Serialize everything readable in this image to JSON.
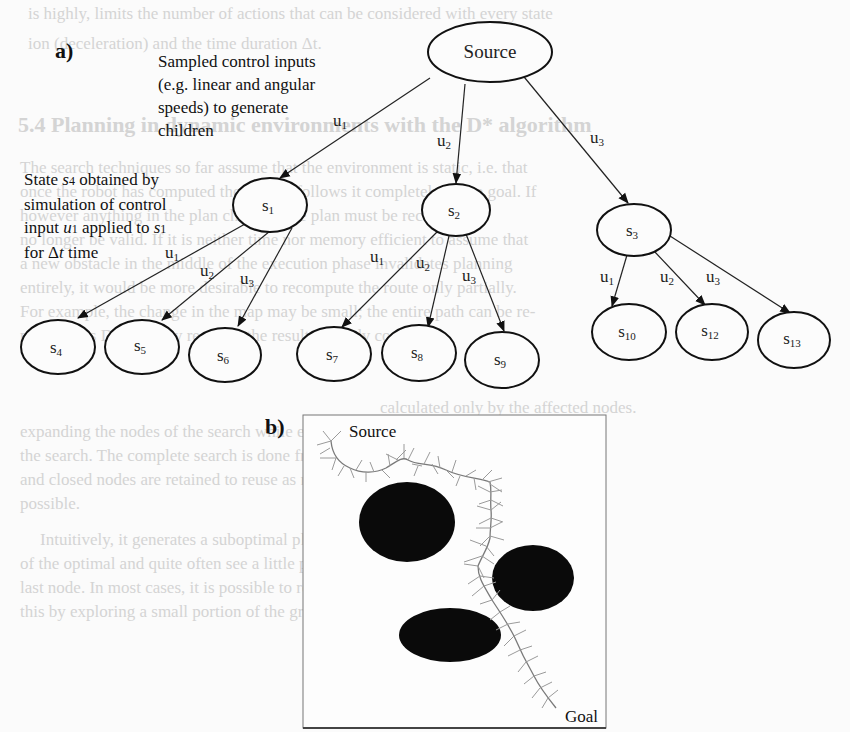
{
  "panel_a": {
    "label": "a)",
    "annotation_top": [
      "Sampled control inputs",
      "(e.g. linear and angular",
      "speeds) to generate",
      "children"
    ],
    "annotation_left": [
      "State s4 obtained by",
      "simulation of control",
      "input u1 applied to s1",
      "for Δt time"
    ],
    "root": {
      "id": "source",
      "label": "Source"
    },
    "level1": [
      {
        "id": "s1",
        "label": "s",
        "sub": "1",
        "edge_label": "u",
        "edge_sub": "1"
      },
      {
        "id": "s2",
        "label": "s",
        "sub": "2",
        "edge_label": "u",
        "edge_sub": "2"
      },
      {
        "id": "s3",
        "label": "s",
        "sub": "3",
        "edge_label": "u",
        "edge_sub": "3"
      }
    ],
    "level2": [
      {
        "id": "s4",
        "label": "s",
        "sub": "4",
        "parent": "s1",
        "edge_label": "u",
        "edge_sub": "1"
      },
      {
        "id": "s5",
        "label": "s",
        "sub": "5",
        "parent": "s1",
        "edge_label": "u",
        "edge_sub": "2"
      },
      {
        "id": "s6",
        "label": "s",
        "sub": "6",
        "parent": "s1",
        "edge_label": "u",
        "edge_sub": "3"
      },
      {
        "id": "s7",
        "label": "s",
        "sub": "7",
        "parent": "s2",
        "edge_label": "u",
        "edge_sub": "1"
      },
      {
        "id": "s8",
        "label": "s",
        "sub": "8",
        "parent": "s2",
        "edge_label": "u",
        "edge_sub": "2"
      },
      {
        "id": "s9",
        "label": "s",
        "sub": "9",
        "parent": "s2",
        "edge_label": "u",
        "edge_sub": "3"
      },
      {
        "id": "s10",
        "label": "s",
        "sub": "10",
        "parent": "s3",
        "edge_label": "u",
        "edge_sub": "1"
      },
      {
        "id": "s12",
        "label": "s",
        "sub": "12",
        "parent": "s3",
        "edge_label": "u",
        "edge_sub": "2"
      },
      {
        "id": "s13",
        "label": "s",
        "sub": "13",
        "parent": "s3",
        "edge_label": "u",
        "edge_sub": "3"
      }
    ]
  },
  "panel_b": {
    "label": "b)",
    "source_label": "Source",
    "goal_label": "Goal",
    "obstacle_color": "#0a0a0a",
    "tree_color": "#9a9a9a"
  },
  "background_bleed_text": [
    "is highly, limits the number of actions that can be considered with every state",
    "ion (deceleration) and the time duration Δt.",
    "5.4   Planning in dynamic environments with the D* algorithm",
    "The search techniques so far assume that the environment is static, i.e. that",
    "once the robot has computed the plan, it follows it completely to the goal. If",
    "however anything in the plan changes, the plan must be recomputed.",
    "no longer be valid. If it is neither time nor memory efficient to assume that",
    "a new obstacle in the middle of the execution phase invalidates planning",
    "entirely, it would be more desirable to recompute the route only partially.",
    "For example, the change in the map may be small; the entire path can be re-",
    "planned, as D* does, by re-using the results already computed.",
    "calculated only by the affected nodes.",
    "expanding the nodes of the search while executing the plan, i.e. replanning",
    "the search. The complete search is done from the robot, in reverse,",
    "and closed nodes are retained to reuse as much information as",
    "possible.",
    "Intuitively, it generates a suboptimal plan after considering a layer",
    "of the optimal and quite often see a little problem and size of the",
    "last node. In most cases, it is possible to recompute the optimal plan as per",
    "this by exploring a small portion of the graph. This should not require"
  ]
}
